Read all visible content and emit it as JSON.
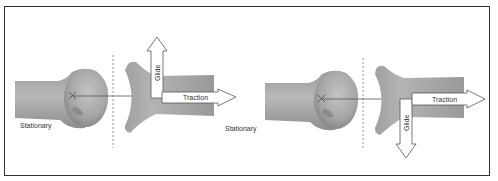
{
  "figure": {
    "left_panel": {
      "stationary_label": "Stationary",
      "glide_label": "Glide",
      "traction_label": "Traction",
      "glide_direction": "up"
    },
    "right_panel": {
      "stationary_label": "Stationary",
      "glide_label": "Glide",
      "traction_label": "Traction",
      "glide_direction": "down"
    },
    "colors": {
      "bone": "#a8a8a8",
      "border": "#333333",
      "arrow_fill": "#ffffff",
      "arrow_stroke": "#555555"
    }
  }
}
